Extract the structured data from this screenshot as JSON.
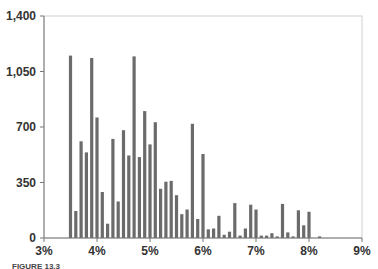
{
  "chart_data": {
    "type": "bar",
    "title": "",
    "xlabel": "",
    "ylabel": "",
    "x_tick_labels": [
      "3%",
      "4%",
      "5%",
      "6%",
      "7%",
      "8%",
      "9%"
    ],
    "y_tick_labels": [
      "0",
      "350",
      "700",
      "1,050",
      "1,400"
    ],
    "xlim": [
      3.0,
      9.0
    ],
    "ylim": [
      0,
      1400
    ],
    "grid": false,
    "legend": null,
    "bar_color": "#6b6b6b",
    "categories": [
      "3.5%",
      "3.6%",
      "3.7%",
      "3.8%",
      "3.9%",
      "4.0%",
      "4.1%",
      "4.2%",
      "4.3%",
      "4.4%",
      "4.5%",
      "4.6%",
      "4.7%",
      "4.8%",
      "4.9%",
      "5.0%",
      "5.1%",
      "5.2%",
      "5.3%",
      "5.4%",
      "5.5%",
      "5.6%",
      "5.7%",
      "5.8%",
      "5.9%",
      "6.0%",
      "6.1%",
      "6.2%",
      "6.3%",
      "6.4%",
      "6.5%",
      "6.6%",
      "6.7%",
      "6.8%",
      "6.9%",
      "7.0%",
      "7.1%",
      "7.2%",
      "7.3%",
      "7.4%",
      "7.5%",
      "7.6%",
      "7.7%",
      "7.8%",
      "7.9%",
      "8.0%",
      "8.2%"
    ],
    "x": [
      3.5,
      3.6,
      3.7,
      3.8,
      3.9,
      4.0,
      4.1,
      4.2,
      4.3,
      4.4,
      4.5,
      4.6,
      4.7,
      4.8,
      4.9,
      5.0,
      5.1,
      5.2,
      5.3,
      5.4,
      5.5,
      5.6,
      5.7,
      5.8,
      5.9,
      6.0,
      6.1,
      6.2,
      6.3,
      6.4,
      6.5,
      6.6,
      6.7,
      6.8,
      6.9,
      7.0,
      7.1,
      7.2,
      7.3,
      7.4,
      7.5,
      7.6,
      7.7,
      7.8,
      7.9,
      8.0,
      8.2
    ],
    "values": [
      1150,
      170,
      610,
      540,
      1135,
      760,
      290,
      90,
      625,
      230,
      680,
      520,
      1145,
      510,
      800,
      590,
      730,
      310,
      355,
      360,
      270,
      150,
      180,
      720,
      120,
      530,
      55,
      60,
      140,
      20,
      40,
      220,
      15,
      60,
      210,
      180,
      15,
      15,
      30,
      10,
      215,
      35,
      10,
      175,
      80,
      165,
      10
    ]
  },
  "caption": "FIGURE 13.3"
}
